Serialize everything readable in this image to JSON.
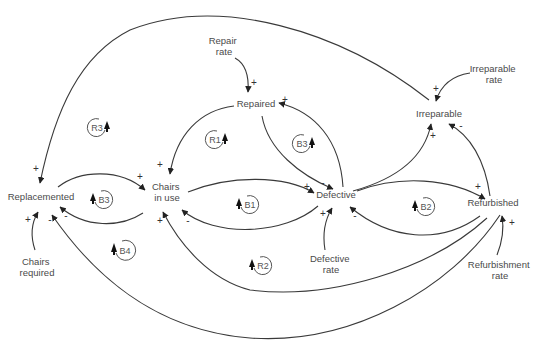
{
  "diagram": {
    "type": "causal-loop-diagram",
    "colors": {
      "line": "#3a3a3a",
      "text": "#4a4a4a",
      "background": "#ffffff"
    },
    "nodes": [
      {
        "id": "repair_rate",
        "lines": [
          "Repair",
          "rate"
        ],
        "x": 224,
        "y": 44
      },
      {
        "id": "repaired",
        "lines": [
          "Repaired"
        ],
        "x": 256,
        "y": 107
      },
      {
        "id": "irreparable_rate",
        "lines": [
          "Irreparable",
          "rate"
        ],
        "x": 494,
        "y": 72
      },
      {
        "id": "irreparable",
        "lines": [
          "Irreparable"
        ],
        "x": 439,
        "y": 117
      },
      {
        "id": "replacemented",
        "lines": [
          "Replacemented"
        ],
        "x": 41,
        "y": 200
      },
      {
        "id": "chairs_in_use",
        "lines": [
          "Chairs",
          "in use"
        ],
        "x": 167,
        "y": 190
      },
      {
        "id": "defective",
        "lines": [
          "Defective"
        ],
        "x": 336,
        "y": 198
      },
      {
        "id": "refurbished",
        "lines": [
          "Refurbished"
        ],
        "x": 493,
        "y": 206
      },
      {
        "id": "chairs_required",
        "lines": [
          "Chairs",
          "required"
        ],
        "x": 37,
        "y": 265
      },
      {
        "id": "defective_rate",
        "lines": [
          "Defective",
          "rate"
        ],
        "x": 331,
        "y": 262
      },
      {
        "id": "refurbishment_rate",
        "lines": [
          "Refurbishment",
          "rate"
        ],
        "x": 500,
        "y": 268
      }
    ],
    "edges": [
      {
        "from": "repair_rate",
        "to": "repaired",
        "sign": "+"
      },
      {
        "from": "repaired",
        "to": "chairs_in_use",
        "sign": "+"
      },
      {
        "from": "repaired",
        "to": "defective",
        "sign": "-"
      },
      {
        "from": "defective",
        "to": "repaired",
        "sign": "+"
      },
      {
        "from": "irreparable",
        "to": "replacemented",
        "sign": "+"
      },
      {
        "from": "irreparable_rate",
        "to": "irreparable",
        "sign": "+"
      },
      {
        "from": "defective",
        "to": "irreparable",
        "sign": "+"
      },
      {
        "from": "refurbished",
        "to": "irreparable",
        "sign": "-"
      },
      {
        "from": "replacemented",
        "to": "chairs_in_use",
        "sign": "+"
      },
      {
        "from": "chairs_in_use",
        "to": "replacemented",
        "sign": "-"
      },
      {
        "from": "chairs_in_use",
        "to": "defective",
        "sign": "+"
      },
      {
        "from": "defective",
        "to": "chairs_in_use",
        "sign": "-"
      },
      {
        "from": "defective",
        "to": "refurbished",
        "sign": "+"
      },
      {
        "from": "refurbished",
        "to": "defective",
        "sign": "-"
      },
      {
        "from": "refurbished",
        "to": "chairs_in_use",
        "sign": "+"
      },
      {
        "from": "refurbished",
        "to": "replacemented",
        "sign": "-"
      },
      {
        "from": "chairs_required",
        "to": "replacemented",
        "sign": "+"
      },
      {
        "from": "defective_rate",
        "to": "defective",
        "sign": "+"
      },
      {
        "from": "refurbishment_rate",
        "to": "refurbished",
        "sign": "+"
      }
    ],
    "loops": [
      {
        "label": "R3",
        "type": "reinforcing",
        "x": 97,
        "y": 128
      },
      {
        "label": "R1",
        "type": "reinforcing",
        "x": 215,
        "y": 140
      },
      {
        "label": "B3",
        "type": "balancing",
        "x": 302,
        "y": 144
      },
      {
        "label": "B3",
        "type": "balancing",
        "x": 103,
        "y": 200
      },
      {
        "label": "B1",
        "type": "balancing",
        "x": 249,
        "y": 205
      },
      {
        "label": "B2",
        "type": "balancing",
        "x": 425,
        "y": 207
      },
      {
        "label": "B4",
        "type": "balancing",
        "x": 124,
        "y": 251
      },
      {
        "label": "R2",
        "type": "reinforcing",
        "x": 262,
        "y": 266
      }
    ]
  }
}
